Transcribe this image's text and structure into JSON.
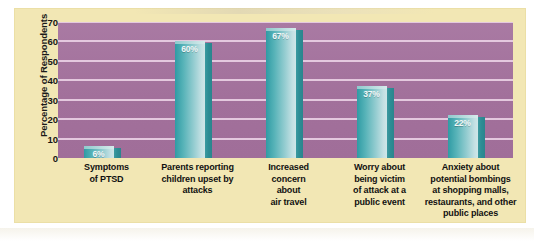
{
  "chart_data": {
    "type": "bar",
    "title": "",
    "xlabel": "",
    "ylabel": "Percentage of Respondents",
    "ylim": [
      0,
      70
    ],
    "yticks": [
      70,
      60,
      50,
      40,
      30,
      20,
      10,
      0
    ],
    "grid": true,
    "legend": "none",
    "categories": [
      "Symptoms\nof PTSD",
      "Parents reporting\nchildren upset by\nattacks",
      "Increased\nconcern\nabout\nair travel",
      "Worry about\nbeing victim\nof attack at a\npublic event",
      "Anxiety about\npotential bombings\nat shopping malls,\nrestaurants, and other\npublic places"
    ],
    "category_lines": [
      [
        "Symptoms",
        "of PTSD"
      ],
      [
        "Parents reporting",
        "children upset by",
        "attacks"
      ],
      [
        "Increased",
        "concern",
        "about",
        "air travel"
      ],
      [
        "Worry about",
        "being victim",
        "of attack at a",
        "public event"
      ],
      [
        "Anxiety about",
        "potential bombings",
        "at shopping malls,",
        "restaurants, and other",
        "public places"
      ]
    ],
    "values": [
      6,
      60,
      67,
      37,
      22
    ],
    "value_labels": [
      "6%",
      "60%",
      "67%",
      "37%",
      "22%"
    ],
    "colors": {
      "plot_background": "#a5739e",
      "figure_background": "#f2e7b4",
      "gridline": "#e9cfe4",
      "bar_light": "#cfe6e8",
      "bar_dark": "#2f9ba4",
      "bar_side": "#2d8d95",
      "value_text": "#f2f8f8",
      "axis_text": "#161616"
    }
  },
  "axis": {
    "y_label": "Percentage of Respondents",
    "ticks": [
      "70",
      "60",
      "50",
      "40",
      "30",
      "20",
      "10",
      "0"
    ]
  }
}
